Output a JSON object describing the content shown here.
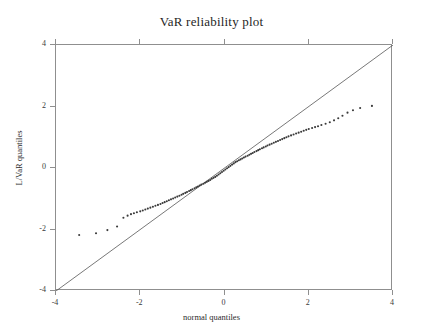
{
  "chart_data": {
    "type": "scatter",
    "title": "VaR reliability plot",
    "xlabel": "normal quantiles",
    "ylabel": "L/VaR quantiles",
    "xlim": [
      -4,
      4
    ],
    "ylim": [
      -4,
      4
    ],
    "xticks": [
      -4,
      -2,
      0,
      2,
      4
    ],
    "yticks": [
      -4,
      -2,
      0,
      2,
      4
    ],
    "xticklabels": [
      "-4",
      "-2",
      "0",
      "2",
      "4"
    ],
    "yticklabels": [
      "-4",
      "-2",
      "0",
      "2",
      "4"
    ],
    "grid": false,
    "legend": null,
    "point_color": "#3a3a3a",
    "line_color": "#555555",
    "frame_color": "#8f8f8f",
    "reference_line": {
      "name": "45-degree identity line",
      "x": [
        -4,
        4
      ],
      "y": [
        -4,
        4
      ]
    },
    "series": [
      {
        "name": "sample quantiles",
        "marker": "dot",
        "points": [
          [
            -3.45,
            -2.18
          ],
          [
            -3.05,
            -2.12
          ],
          [
            -2.78,
            -2.02
          ],
          [
            -2.55,
            -1.9
          ],
          [
            -2.4,
            -1.62
          ],
          [
            -2.3,
            -1.55
          ],
          [
            -2.22,
            -1.5
          ],
          [
            -2.15,
            -1.47
          ],
          [
            -2.08,
            -1.44
          ],
          [
            -2.0,
            -1.41
          ],
          [
            -1.94,
            -1.38
          ],
          [
            -1.88,
            -1.35
          ],
          [
            -1.82,
            -1.32
          ],
          [
            -1.76,
            -1.29
          ],
          [
            -1.7,
            -1.26
          ],
          [
            -1.64,
            -1.23
          ],
          [
            -1.58,
            -1.2
          ],
          [
            -1.52,
            -1.17
          ],
          [
            -1.47,
            -1.14
          ],
          [
            -1.42,
            -1.11
          ],
          [
            -1.37,
            -1.08
          ],
          [
            -1.32,
            -1.05
          ],
          [
            -1.27,
            -1.02
          ],
          [
            -1.22,
            -0.99
          ],
          [
            -1.17,
            -0.96
          ],
          [
            -1.12,
            -0.93
          ],
          [
            -1.07,
            -0.9
          ],
          [
            -1.02,
            -0.87
          ],
          [
            -0.98,
            -0.84
          ],
          [
            -0.93,
            -0.81
          ],
          [
            -0.89,
            -0.78
          ],
          [
            -0.84,
            -0.75
          ],
          [
            -0.8,
            -0.72
          ],
          [
            -0.76,
            -0.69
          ],
          [
            -0.71,
            -0.66
          ],
          [
            -0.67,
            -0.63
          ],
          [
            -0.63,
            -0.6
          ],
          [
            -0.59,
            -0.57
          ],
          [
            -0.55,
            -0.54
          ],
          [
            -0.5,
            -0.51
          ],
          [
            -0.46,
            -0.48
          ],
          [
            -0.42,
            -0.45
          ],
          [
            -0.38,
            -0.42
          ],
          [
            -0.34,
            -0.39
          ],
          [
            -0.3,
            -0.35
          ],
          [
            -0.26,
            -0.32
          ],
          [
            -0.22,
            -0.29
          ],
          [
            -0.18,
            -0.25
          ],
          [
            -0.14,
            -0.21
          ],
          [
            -0.1,
            -0.17
          ],
          [
            -0.06,
            -0.13
          ],
          [
            -0.02,
            -0.09
          ],
          [
            0.02,
            -0.05
          ],
          [
            0.06,
            -0.01
          ],
          [
            0.1,
            0.03
          ],
          [
            0.14,
            0.07
          ],
          [
            0.18,
            0.11
          ],
          [
            0.22,
            0.15
          ],
          [
            0.26,
            0.19
          ],
          [
            0.3,
            0.22
          ],
          [
            0.34,
            0.25
          ],
          [
            0.38,
            0.28
          ],
          [
            0.42,
            0.31
          ],
          [
            0.46,
            0.34
          ],
          [
            0.5,
            0.37
          ],
          [
            0.55,
            0.4
          ],
          [
            0.59,
            0.43
          ],
          [
            0.63,
            0.46
          ],
          [
            0.67,
            0.49
          ],
          [
            0.71,
            0.52
          ],
          [
            0.76,
            0.55
          ],
          [
            0.8,
            0.58
          ],
          [
            0.84,
            0.61
          ],
          [
            0.89,
            0.64
          ],
          [
            0.93,
            0.67
          ],
          [
            0.98,
            0.7
          ],
          [
            1.02,
            0.73
          ],
          [
            1.07,
            0.76
          ],
          [
            1.12,
            0.79
          ],
          [
            1.17,
            0.82
          ],
          [
            1.22,
            0.85
          ],
          [
            1.27,
            0.88
          ],
          [
            1.32,
            0.91
          ],
          [
            1.37,
            0.94
          ],
          [
            1.42,
            0.97
          ],
          [
            1.47,
            1.0
          ],
          [
            1.52,
            1.03
          ],
          [
            1.58,
            1.06
          ],
          [
            1.64,
            1.09
          ],
          [
            1.7,
            1.12
          ],
          [
            1.76,
            1.15
          ],
          [
            1.82,
            1.18
          ],
          [
            1.88,
            1.21
          ],
          [
            1.94,
            1.24
          ],
          [
            2.0,
            1.27
          ],
          [
            2.08,
            1.3
          ],
          [
            2.15,
            1.33
          ],
          [
            2.22,
            1.36
          ],
          [
            2.3,
            1.4
          ],
          [
            2.4,
            1.44
          ],
          [
            2.5,
            1.49
          ],
          [
            2.6,
            1.55
          ],
          [
            2.7,
            1.62
          ],
          [
            2.8,
            1.7
          ],
          [
            2.92,
            1.8
          ],
          [
            3.05,
            1.88
          ],
          [
            3.22,
            1.95
          ],
          [
            3.5,
            2.02
          ]
        ]
      }
    ]
  }
}
